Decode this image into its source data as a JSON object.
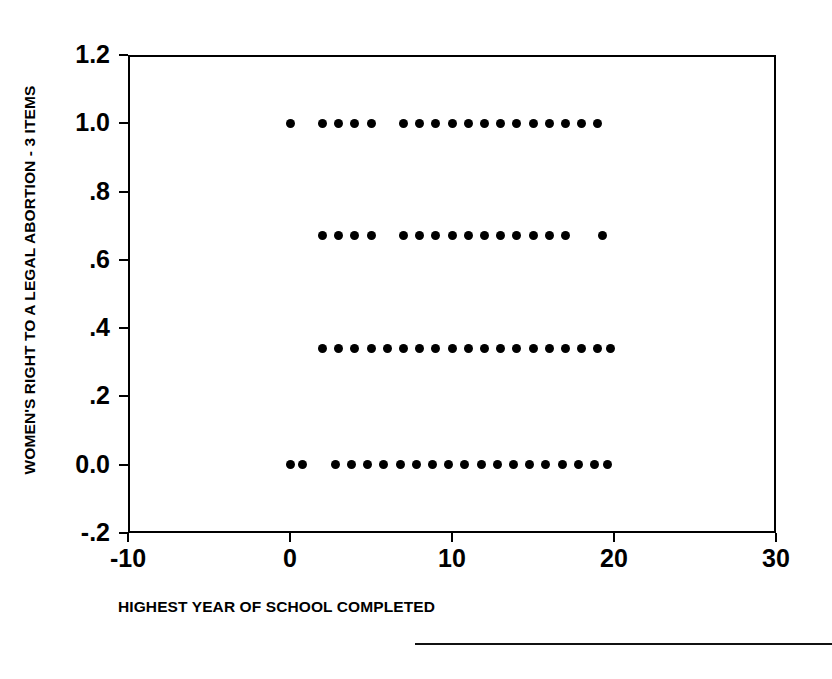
{
  "chart_data": {
    "type": "scatter",
    "title": "",
    "xlabel": "HIGHEST YEAR OF SCHOOL COMPLETED",
    "ylabel": "WOMEN'S RIGHT TO A LEGAL ABORTION - 3 ITEMS",
    "xlim": [
      -10,
      30
    ],
    "ylim": [
      -0.2,
      1.2
    ],
    "grid": false,
    "legend": null,
    "xticks": [
      {
        "value": -10,
        "label": "-10"
      },
      {
        "value": 0,
        "label": "0"
      },
      {
        "value": 10,
        "label": "10"
      },
      {
        "value": 20,
        "label": "20"
      },
      {
        "value": 30,
        "label": "30"
      }
    ],
    "yticks": [
      {
        "value": 1.2,
        "label": "1.2"
      },
      {
        "value": 1.0,
        "label": "1.0"
      },
      {
        "value": 0.8,
        "label": ".8"
      },
      {
        "value": 0.6,
        "label": ".6"
      },
      {
        "value": 0.4,
        "label": ".4"
      },
      {
        "value": 0.2,
        "label": ".2"
      },
      {
        "value": 0.0,
        "label": "0.0"
      },
      {
        "value": -0.2,
        "label": "-.2"
      }
    ],
    "marker": {
      "shape": "circle",
      "color": "#000000",
      "size": 9
    },
    "series": [
      {
        "name": "respondents",
        "points": [
          {
            "x": 0.0,
            "y": 1.0
          },
          {
            "x": 2.0,
            "y": 1.0
          },
          {
            "x": 3.0,
            "y": 1.0
          },
          {
            "x": 4.0,
            "y": 1.0
          },
          {
            "x": 5.0,
            "y": 1.0
          },
          {
            "x": 7.0,
            "y": 1.0
          },
          {
            "x": 8.0,
            "y": 1.0
          },
          {
            "x": 9.0,
            "y": 1.0
          },
          {
            "x": 10.0,
            "y": 1.0
          },
          {
            "x": 11.0,
            "y": 1.0
          },
          {
            "x": 12.0,
            "y": 1.0
          },
          {
            "x": 13.0,
            "y": 1.0
          },
          {
            "x": 14.0,
            "y": 1.0
          },
          {
            "x": 15.0,
            "y": 1.0
          },
          {
            "x": 16.0,
            "y": 1.0
          },
          {
            "x": 17.0,
            "y": 1.0
          },
          {
            "x": 18.0,
            "y": 1.0
          },
          {
            "x": 19.0,
            "y": 1.0
          },
          {
            "x": 2.0,
            "y": 0.67
          },
          {
            "x": 3.0,
            "y": 0.67
          },
          {
            "x": 4.0,
            "y": 0.67
          },
          {
            "x": 5.0,
            "y": 0.67
          },
          {
            "x": 7.0,
            "y": 0.67
          },
          {
            "x": 8.0,
            "y": 0.67
          },
          {
            "x": 9.0,
            "y": 0.67
          },
          {
            "x": 10.0,
            "y": 0.67
          },
          {
            "x": 11.0,
            "y": 0.67
          },
          {
            "x": 12.0,
            "y": 0.67
          },
          {
            "x": 13.0,
            "y": 0.67
          },
          {
            "x": 14.0,
            "y": 0.67
          },
          {
            "x": 15.0,
            "y": 0.67
          },
          {
            "x": 16.0,
            "y": 0.67
          },
          {
            "x": 17.0,
            "y": 0.67
          },
          {
            "x": 19.3,
            "y": 0.67
          },
          {
            "x": 2.0,
            "y": 0.34
          },
          {
            "x": 3.0,
            "y": 0.34
          },
          {
            "x": 4.0,
            "y": 0.34
          },
          {
            "x": 5.0,
            "y": 0.34
          },
          {
            "x": 6.0,
            "y": 0.34
          },
          {
            "x": 7.0,
            "y": 0.34
          },
          {
            "x": 8.0,
            "y": 0.34
          },
          {
            "x": 9.0,
            "y": 0.34
          },
          {
            "x": 10.0,
            "y": 0.34
          },
          {
            "x": 11.0,
            "y": 0.34
          },
          {
            "x": 12.0,
            "y": 0.34
          },
          {
            "x": 13.0,
            "y": 0.34
          },
          {
            "x": 14.0,
            "y": 0.34
          },
          {
            "x": 15.0,
            "y": 0.34
          },
          {
            "x": 16.0,
            "y": 0.34
          },
          {
            "x": 17.0,
            "y": 0.34
          },
          {
            "x": 18.0,
            "y": 0.34
          },
          {
            "x": 19.0,
            "y": 0.34
          },
          {
            "x": 19.8,
            "y": 0.34
          },
          {
            "x": 0.0,
            "y": 0.0
          },
          {
            "x": 0.8,
            "y": 0.0
          },
          {
            "x": 2.8,
            "y": 0.0
          },
          {
            "x": 3.8,
            "y": 0.0
          },
          {
            "x": 4.8,
            "y": 0.0
          },
          {
            "x": 5.8,
            "y": 0.0
          },
          {
            "x": 6.8,
            "y": 0.0
          },
          {
            "x": 7.8,
            "y": 0.0
          },
          {
            "x": 8.8,
            "y": 0.0
          },
          {
            "x": 9.8,
            "y": 0.0
          },
          {
            "x": 10.8,
            "y": 0.0
          },
          {
            "x": 11.8,
            "y": 0.0
          },
          {
            "x": 12.8,
            "y": 0.0
          },
          {
            "x": 13.8,
            "y": 0.0
          },
          {
            "x": 14.8,
            "y": 0.0
          },
          {
            "x": 15.8,
            "y": 0.0
          },
          {
            "x": 16.8,
            "y": 0.0
          },
          {
            "x": 17.8,
            "y": 0.0
          },
          {
            "x": 18.8,
            "y": 0.0
          },
          {
            "x": 19.6,
            "y": 0.0
          }
        ]
      }
    ]
  }
}
